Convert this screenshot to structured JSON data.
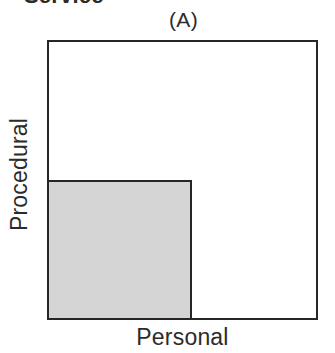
{
  "figure": {
    "heading": "Service",
    "panel_label": "(A)",
    "x_axis_label": "Personal",
    "y_axis_label": "Procedural"
  },
  "chart_data": {
    "type": "area",
    "title": "Service",
    "panel": "(A)",
    "xlabel": "Personal",
    "ylabel": "Procedural",
    "grid": false,
    "legend": false,
    "xlim": [
      0,
      1
    ],
    "ylim": [
      0,
      1
    ],
    "shapes": [
      {
        "name": "outer-rect",
        "role": "total-space",
        "x": 0,
        "y": 0,
        "width": 1.0,
        "height": 1.0,
        "fill": "#ffffff",
        "stroke": "#262626",
        "stroke_width_px": 2
      },
      {
        "name": "inner-rect",
        "role": "shaded-subset",
        "x": 0,
        "y": 0,
        "width": 0.53,
        "height": 0.5,
        "fill": "#d5d5d5",
        "stroke": "#262626",
        "stroke_width_px": 2
      }
    ],
    "colors": {
      "outer_fill": "#ffffff",
      "inner_fill": "#d5d5d5",
      "stroke": "#262626",
      "text": "#2b2b2b",
      "background": "#ffffff"
    }
  }
}
